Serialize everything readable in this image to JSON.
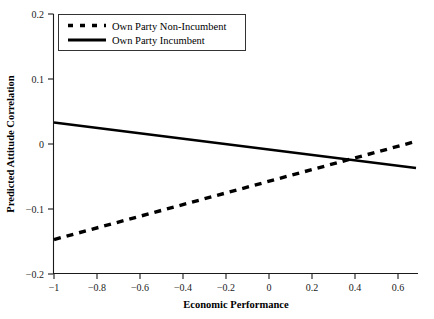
{
  "chart_data": {
    "type": "line",
    "title": "",
    "xlabel": "Economic Performance",
    "ylabel": "Predicted Attitude Correlation",
    "xlim": [
      -1.0,
      0.65
    ],
    "ylim": [
      -0.2,
      0.2
    ],
    "grid": false,
    "legend_position": "top-left",
    "xticks": [
      -1,
      -0.8,
      -0.6,
      -0.4,
      -0.2,
      0,
      0.2,
      0.4,
      0.6
    ],
    "xtick_labels": [
      "−1",
      "−0.8",
      "−0.6",
      "−0.4",
      "−0.2",
      "0",
      "0.2",
      "0.4",
      "0.6"
    ],
    "yticks": [
      0.2,
      0.1,
      0,
      -0.1,
      -0.2
    ],
    "ytick_labels": [
      "0.2",
      "0.1",
      "0",
      "−0.1",
      "−0.2"
    ],
    "series": [
      {
        "name": "Own Party Non-Incumbent",
        "style": "dashed",
        "color": "#000000",
        "x": [
          -1.0,
          0.65
        ],
        "values": [
          -0.147,
          0.004
        ]
      },
      {
        "name": "Own Party Incumbent",
        "style": "solid",
        "color": "#000000",
        "x": [
          -1.0,
          0.65
        ],
        "values": [
          0.033,
          -0.037
        ]
      }
    ],
    "annotations": []
  },
  "legend": {
    "items": [
      {
        "label": "Own Party Non-Incumbent",
        "style": "dashed"
      },
      {
        "label": "Own Party Incumbent",
        "style": "solid"
      }
    ]
  },
  "axes": {
    "x_title": "Economic Performance",
    "y_title": "Predicted Attitude Correlation",
    "x_labels": [
      "−1",
      "−0.8",
      "−0.6",
      "−0.4",
      "−0.2",
      "0",
      "0.2",
      "0.4",
      "0.6"
    ],
    "y_labels": [
      "0.2",
      "0.1",
      "0",
      "−0.1",
      "−0.2"
    ]
  },
  "colors": {
    "series": "#000000",
    "axis": "#1a1a1a",
    "background": "#ffffff",
    "legend_border": "#333333"
  }
}
